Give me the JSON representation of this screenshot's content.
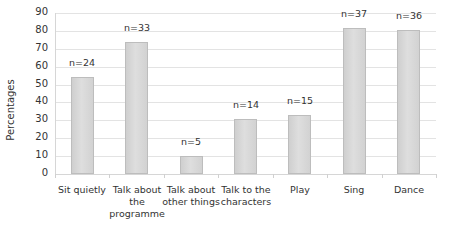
{
  "chart_data": {
    "type": "bar",
    "title": "",
    "xlabel": "",
    "ylabel": "Percentages",
    "ylim": [
      0,
      90
    ],
    "yticks": [
      0,
      10,
      20,
      30,
      40,
      50,
      60,
      70,
      80,
      90
    ],
    "grid": true,
    "legend": null,
    "categories": [
      "Sit quietly",
      "Talk about the programme",
      "Talk about other things",
      "Talk to the characters",
      "Play",
      "Sing",
      "Dance"
    ],
    "category_lines": [
      [
        "Sit quietly"
      ],
      [
        "Talk about",
        "the",
        "programme"
      ],
      [
        "Talk about",
        "other things"
      ],
      [
        "Talk to the",
        "characters"
      ],
      [
        "Play"
      ],
      [
        "Sing"
      ],
      [
        "Dance"
      ]
    ],
    "values": [
      54.5,
      74,
      10,
      30.5,
      33,
      81.5,
      80.5
    ],
    "annotations": [
      "n=24",
      "n=33",
      "n=5",
      "n=14",
      "n=15",
      "n=37",
      "n=36"
    ]
  },
  "colors": {
    "bar": "#d6d6d6",
    "bar_border": "#bdbdbd",
    "grid": "#e3e3e3",
    "text": "#333333"
  }
}
